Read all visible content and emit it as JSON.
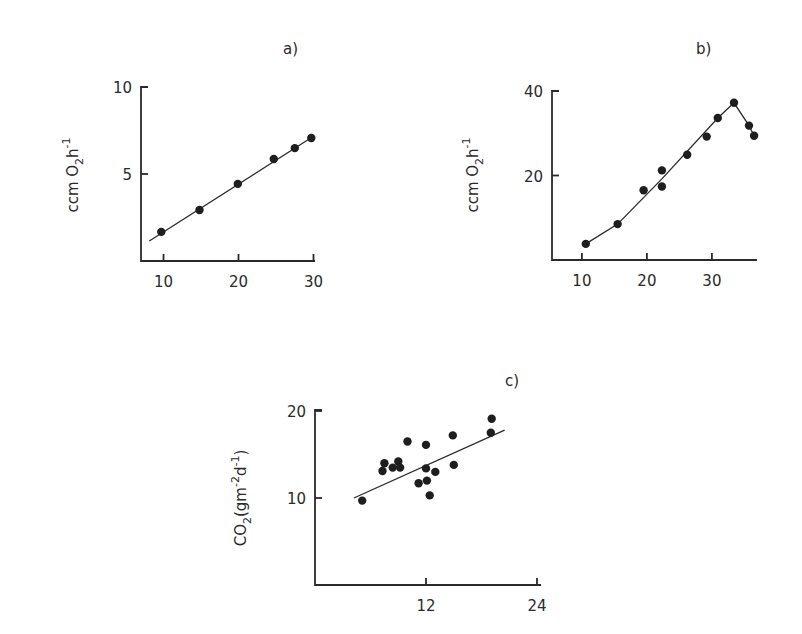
{
  "chart_data": [
    {
      "id": "a",
      "type": "scatter",
      "title": "a)",
      "xlabel": "",
      "ylabel": "ccm O2h-1",
      "ylabel_parts": {
        "base": "ccm O",
        "sub": "2",
        "mid": "h",
        "sup": "-1"
      },
      "xlim": [
        7,
        30.5
      ],
      "ylim": [
        0,
        10
      ],
      "xticks": [
        10,
        20,
        30
      ],
      "yticks": [
        5,
        10
      ],
      "grid": false,
      "frame": {
        "x0": 141,
        "x1": 315,
        "y_top": 87,
        "y_bottom": 261,
        "x_origin_value": 7.0,
        "x_px_per_unit": 7.5,
        "y_px_per_unit": 17.4
      },
      "points": [
        {
          "x": 9.7,
          "y": 1.67
        },
        {
          "x": 14.8,
          "y": 2.93
        },
        {
          "x": 19.9,
          "y": 4.43
        },
        {
          "x": 24.7,
          "y": 5.86
        },
        {
          "x": 27.5,
          "y": 6.49
        },
        {
          "x": 29.7,
          "y": 7.07
        }
      ],
      "line": {
        "type": "linear-fit",
        "points": [
          {
            "x": 8.1,
            "y": 1.15
          },
          {
            "x": 30.1,
            "y": 7.2
          }
        ]
      }
    },
    {
      "id": "b",
      "type": "line",
      "title": "b)",
      "xlabel": "",
      "ylabel": "ccm O2h-1",
      "ylabel_parts": {
        "base": "ccm O",
        "sub": "2",
        "mid": "h",
        "sup": "-1"
      },
      "xlim": [
        5.4,
        37
      ],
      "ylim": [
        0,
        40
      ],
      "xticks": [
        10,
        20,
        30
      ],
      "yticks": [
        20,
        40
      ],
      "grid": false,
      "frame": {
        "x0": 552,
        "x1": 757,
        "y_top": 91,
        "y_bottom": 260,
        "x_origin_value": 5.4,
        "x_px_per_unit": 6.5,
        "y_px_per_unit": 4.225
      },
      "points": [
        {
          "x": 10.6,
          "y": 3.8
        },
        {
          "x": 15.5,
          "y": 8.5
        },
        {
          "x": 19.5,
          "y": 16.5
        },
        {
          "x": 22.3,
          "y": 21.2
        },
        {
          "x": 22.3,
          "y": 17.4
        },
        {
          "x": 26.2,
          "y": 24.9
        },
        {
          "x": 29.2,
          "y": 29.2
        },
        {
          "x": 30.9,
          "y": 33.6
        },
        {
          "x": 33.4,
          "y": 37.2
        },
        {
          "x": 35.7,
          "y": 31.8
        },
        {
          "x": 36.5,
          "y": 29.4
        }
      ],
      "line": {
        "type": "piecewise",
        "points": [
          {
            "x": 10.6,
            "y": 3.8
          },
          {
            "x": 15.5,
            "y": 8.5
          },
          {
            "x": 22.3,
            "y": 19.2
          },
          {
            "x": 30.9,
            "y": 33.6
          },
          {
            "x": 33.4,
            "y": 37.2
          },
          {
            "x": 35.7,
            "y": 31.8
          },
          {
            "x": 36.5,
            "y": 29.4
          }
        ]
      }
    },
    {
      "id": "c",
      "type": "scatter",
      "title": "c)",
      "xlabel": "",
      "ylabel": "CO2(gm-2d-1)",
      "ylabel_parts": {
        "base": "CO",
        "sub": "2",
        "rest1": "(gm",
        "sup1": "-2",
        "rest2": "d",
        "sup2": "-1",
        "close": ")"
      },
      "xlim": [
        0,
        24.5
      ],
      "ylim": [
        0,
        20
      ],
      "xticks": [
        12,
        24
      ],
      "yticks": [
        10,
        20
      ],
      "grid": false,
      "frame": {
        "x0": 315,
        "x1": 541,
        "y_top": 410,
        "y_bottom": 585,
        "x_origin_value": 0,
        "x_px_per_unit": 9.25,
        "y_px_per_unit": 8.7
      },
      "points": [
        {
          "x": 5.1,
          "y": 9.7
        },
        {
          "x": 7.3,
          "y": 13.1
        },
        {
          "x": 7.5,
          "y": 14.0
        },
        {
          "x": 8.4,
          "y": 13.5
        },
        {
          "x": 9.0,
          "y": 14.2
        },
        {
          "x": 9.2,
          "y": 13.5
        },
        {
          "x": 10.0,
          "y": 16.5
        },
        {
          "x": 11.2,
          "y": 11.7
        },
        {
          "x": 12.0,
          "y": 16.1
        },
        {
          "x": 12.0,
          "y": 13.4
        },
        {
          "x": 12.1,
          "y": 12.0
        },
        {
          "x": 12.4,
          "y": 10.3
        },
        {
          "x": 13.0,
          "y": 13.0
        },
        {
          "x": 14.9,
          "y": 17.2
        },
        {
          "x": 15.0,
          "y": 13.8
        },
        {
          "x": 19.1,
          "y": 19.1
        },
        {
          "x": 19.0,
          "y": 17.5
        }
      ],
      "line": {
        "type": "linear-fit",
        "points": [
          {
            "x": 4.2,
            "y": 10.0
          },
          {
            "x": 20.5,
            "y": 17.8
          }
        ]
      }
    }
  ],
  "panels": {
    "a": {
      "label": "a)",
      "label_pos": [
        283,
        54
      ],
      "ylabel_pos": [
        78,
        175
      ]
    },
    "b": {
      "label": "b)",
      "label_pos": [
        696,
        54
      ],
      "ylabel_pos": [
        478,
        175
      ]
    },
    "c": {
      "label": "c)",
      "label_pos": [
        505,
        386
      ],
      "ylabel_pos": [
        246,
        498
      ]
    }
  },
  "style": {
    "ink": "#2a2a2a",
    "dot": "#1e1e1e",
    "background": "#ffffff",
    "dot_radius": 4.2
  }
}
